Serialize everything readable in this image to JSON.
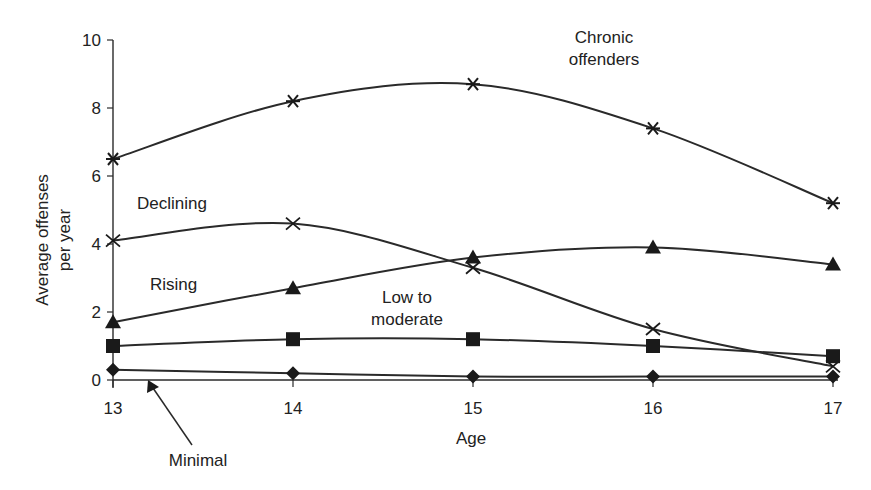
{
  "caption": "",
  "chart_data": {
    "type": "line",
    "title": "",
    "xlabel": "Age",
    "ylabel": "Average offenses per year",
    "ylabel_lines": [
      "Average offenses",
      "per year"
    ],
    "x": [
      13,
      14,
      15,
      16,
      17
    ],
    "x_tick_labels": [
      "13",
      "14",
      "15",
      "16",
      "17"
    ],
    "y_ticks": [
      0,
      2,
      4,
      6,
      8,
      10
    ],
    "y_tick_labels": [
      "0",
      "2",
      "4",
      "6",
      "8",
      "10"
    ],
    "ylim": [
      0,
      10
    ],
    "grid": false,
    "legend": "inline labels",
    "series": [
      {
        "name": "Chronic offenders",
        "label_lines": [
          "Chronic",
          "offenders"
        ],
        "marker": "asterisk",
        "values": [
          6.5,
          8.2,
          8.7,
          7.4,
          5.2
        ]
      },
      {
        "name": "Declining",
        "label_lines": [
          "Declining"
        ],
        "marker": "x",
        "values": [
          4.1,
          4.6,
          3.3,
          1.5,
          0.4
        ]
      },
      {
        "name": "Rising",
        "label_lines": [
          "Rising"
        ],
        "marker": "triangle",
        "values": [
          1.7,
          2.7,
          3.6,
          3.9,
          3.4
        ]
      },
      {
        "name": "Low to moderate",
        "label_lines": [
          "Low to",
          "moderate"
        ],
        "marker": "square",
        "values": [
          1.0,
          1.2,
          1.2,
          1.0,
          0.7
        ]
      },
      {
        "name": "Minimal",
        "label_lines": [
          "Minimal"
        ],
        "marker": "diamond",
        "values": [
          0.3,
          0.2,
          0.1,
          0.1,
          0.1
        ]
      }
    ],
    "annotations": [
      {
        "text": "Minimal",
        "type": "arrow-label"
      }
    ]
  }
}
